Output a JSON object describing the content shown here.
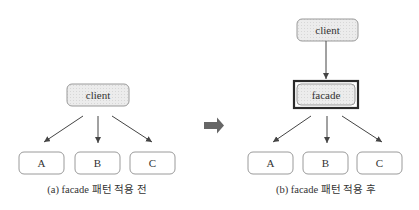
{
  "left_diagram": {
    "client_label": "client",
    "nodes": [
      "A",
      "B",
      "C"
    ],
    "caption": "(a) facade 패턴 적용 전"
  },
  "transition_arrow": {
    "icon": "right-arrow-icon",
    "color": "#666666"
  },
  "right_diagram": {
    "client_label": "client",
    "facade_label": "facade",
    "nodes": [
      "A",
      "B",
      "C"
    ],
    "caption": "(b) facade 패턴 적용 후"
  }
}
